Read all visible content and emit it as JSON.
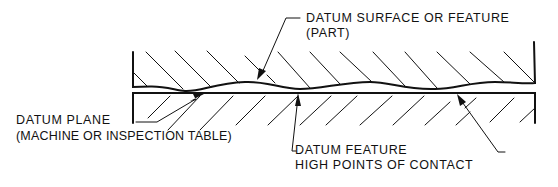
{
  "diagram": {
    "labels": {
      "datum_surface_line1": "DATUM SURFACE OR FEATURE",
      "datum_surface_line2": "(PART)",
      "datum_plane_line1": "DATUM PLANE",
      "datum_plane_line2": "(MACHINE OR INSPECTION TABLE)",
      "datum_feature_line1": "DATUM FEATURE",
      "datum_feature_line2": "HIGH POINTS OF CONTACT"
    },
    "colors": {
      "ink": "#111111",
      "background": "#ffffff"
    }
  }
}
